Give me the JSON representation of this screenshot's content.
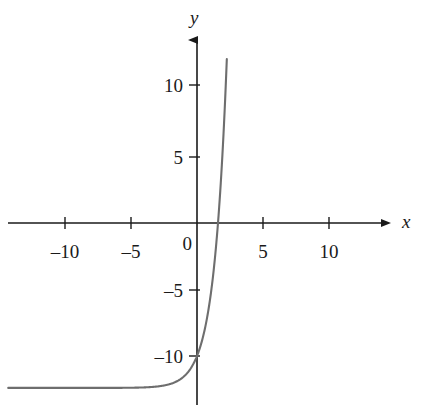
{
  "figure": {
    "background_color": "#ffffff",
    "curve_color": "#6e6e6e",
    "axis_color": "#1a1a1a",
    "text_color": "#1a1a1a"
  },
  "axes": {
    "x_label": "x",
    "y_label": "y",
    "origin_label": "0",
    "x_ticks": [
      {
        "value": -10,
        "label": "–10"
      },
      {
        "value": -5,
        "label": "–5"
      },
      {
        "value": 5,
        "label": "5"
      },
      {
        "value": 10,
        "label": "10"
      }
    ],
    "y_ticks": [
      {
        "value": 10,
        "label": "10"
      },
      {
        "value": 5,
        "label": "5"
      },
      {
        "value": -5,
        "label": "–5"
      },
      {
        "value": -10,
        "label": "–10"
      }
    ]
  },
  "chart_data": {
    "type": "line",
    "title": "",
    "xlabel": "x",
    "ylabel": "y",
    "grid": false,
    "legend": null,
    "xlim": [
      -14.3,
      17.2
    ],
    "ylim": [
      -14.6,
      13.4
    ],
    "x_ticks": [
      -10,
      -5,
      5,
      10
    ],
    "y_ticks": [
      10,
      5,
      -5,
      -10
    ],
    "x_tick_labels": [
      "–10",
      "–5",
      "5",
      "10"
    ],
    "y_tick_labels": [
      "10",
      "5",
      "–5",
      "–10"
    ],
    "axis_style": "arrowed-cartesian",
    "asymptote": {
      "type": "horizontal",
      "y": -12.4
    },
    "x_intercept": 1.4,
    "y_intercept": -10.0,
    "series": [
      {
        "name": "exponential curve",
        "description": "increasing exponential shifted down, horizontal asymptote y = -12.4",
        "points": [
          {
            "x": -14.3,
            "y": -12.4
          },
          {
            "x": -13.0,
            "y": -12.4
          },
          {
            "x": -11.0,
            "y": -12.39
          },
          {
            "x": -9.0,
            "y": -12.38
          },
          {
            "x": -7.0,
            "y": -12.36
          },
          {
            "x": -6.0,
            "y": -12.34
          },
          {
            "x": -5.0,
            "y": -12.31
          },
          {
            "x": -4.5,
            "y": -12.29
          },
          {
            "x": -4.0,
            "y": -12.26
          },
          {
            "x": -3.5,
            "y": -12.22
          },
          {
            "x": -3.0,
            "y": -12.16
          },
          {
            "x": -2.5,
            "y": -12.08
          },
          {
            "x": -2.0,
            "y": -11.96
          },
          {
            "x": -1.75,
            "y": -11.87
          },
          {
            "x": -1.5,
            "y": -11.76
          },
          {
            "x": -1.25,
            "y": -11.62
          },
          {
            "x": -1.0,
            "y": -11.44
          },
          {
            "x": -0.75,
            "y": -11.21
          },
          {
            "x": -0.5,
            "y": -10.91
          },
          {
            "x": -0.25,
            "y": -10.52
          },
          {
            "x": 0.0,
            "y": -10.0
          },
          {
            "x": 0.25,
            "y": -9.34
          },
          {
            "x": 0.5,
            "y": -8.46
          },
          {
            "x": 0.75,
            "y": -7.31
          },
          {
            "x": 1.0,
            "y": -5.8
          },
          {
            "x": 1.25,
            "y": -3.81
          },
          {
            "x": 1.4,
            "y": 0.0
          },
          {
            "x": 1.5,
            "y": -1.2
          },
          {
            "x": 1.75,
            "y": 2.23
          },
          {
            "x": 2.0,
            "y": 6.75
          },
          {
            "x": 2.1,
            "y": 8.94
          },
          {
            "x": 2.2,
            "y": 11.4
          },
          {
            "x": 2.3,
            "y": 13.4
          }
        ]
      }
    ]
  }
}
